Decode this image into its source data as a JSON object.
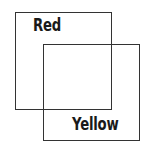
{
  "diagram": {
    "shapes": [
      {
        "id": "red",
        "label": "Red",
        "box": {
          "x": 15,
          "y": 12,
          "w": 97,
          "h": 98
        }
      },
      {
        "id": "yellow",
        "label": "Yellow",
        "box": {
          "x": 43,
          "y": 44,
          "w": 97,
          "h": 97
        }
      }
    ],
    "colors": {
      "stroke": "#333333",
      "text": "#1a1a1a",
      "background": "#ffffff"
    }
  }
}
